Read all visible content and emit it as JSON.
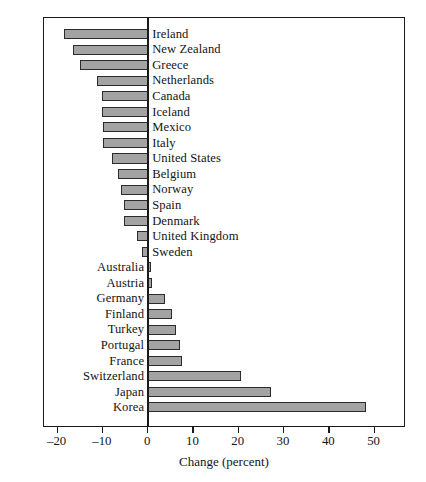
{
  "chart_data": {
    "type": "bar",
    "orientation": "horizontal",
    "title": "",
    "xlabel": "Change (percent)",
    "ylabel": "",
    "xlim": [
      -23.0,
      56.5
    ],
    "xticks": [
      -20,
      -10,
      0,
      10,
      20,
      30,
      40,
      50
    ],
    "xtick_labels": [
      "–20",
      "–10",
      "0",
      "10",
      "20",
      "30",
      "40",
      "50"
    ],
    "grid": false,
    "legend": null,
    "zero_line": true,
    "bar_color": "#a3a3a3",
    "bar_edge_color": "#2b2b2b",
    "frame_color": "#1a1a1a",
    "background": "#ffffff",
    "categories": [
      "Ireland",
      "New Zealand",
      "Greece",
      "Netherlands",
      "Canada",
      "Iceland",
      "Mexico",
      "Italy",
      "United States",
      "Belgium",
      "Norway",
      "Spain",
      "Denmark",
      "United Kingdom",
      "Sweden",
      "Australia",
      "Austria",
      "Germany",
      "Finland",
      "Turkey",
      "Portugal",
      "France",
      "Switzerland",
      "Japan",
      "Korea"
    ],
    "values": [
      -18.5,
      -16.5,
      -15.0,
      -11.2,
      -10.1,
      -10.1,
      -9.9,
      -9.9,
      -8.0,
      -6.6,
      -5.9,
      -5.4,
      -5.4,
      -2.4,
      -1.3,
      0.7,
      0.9,
      3.8,
      5.3,
      6.2,
      7.0,
      7.5,
      20.6,
      27.1,
      48.2
    ]
  },
  "axis": {
    "title": "Change (percent)"
  }
}
